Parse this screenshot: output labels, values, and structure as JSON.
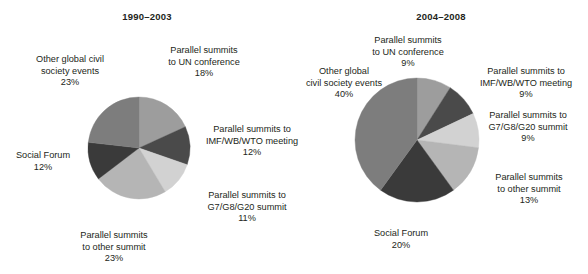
{
  "figure": {
    "type": "two-pie-figure",
    "background": "#ffffff",
    "text_color": "#231f20"
  },
  "palette": {
    "un_conference": "#9d9d9d",
    "imf_wb_wto": "#4a4a4a",
    "g7_g8_g20": "#d2d2d2",
    "other_summit": "#b5b5b5",
    "social_forum": "#3a3a3a",
    "other_global_civil_society": "#7d7d7d"
  },
  "chart_data": [
    {
      "type": "pie",
      "title": "1990–2003",
      "xlabel": "",
      "ylabel": "",
      "start_angle": 0,
      "direction": "clockwise",
      "legend": "none",
      "grid": false,
      "categories": [
        "Parallel summits to UN conference",
        "Parallel summits to IMF/WB/WTO meeting",
        "Parallel summits to G7/G8/G20 summit",
        "Parallel summits to other summit",
        "Social Forum",
        "Other global civil society events"
      ],
      "values": [
        18,
        12,
        11,
        23,
        12,
        23
      ],
      "value_labels": [
        "18%",
        "12%",
        "11%",
        "23%",
        "12%",
        "23%"
      ],
      "colors": [
        "#9d9d9d",
        "#4a4a4a",
        "#d2d2d2",
        "#b5b5b5",
        "#3a3a3a",
        "#7d7d7d"
      ],
      "slices": [
        {
          "key": "un_conference",
          "lines": [
            "Parallel summits",
            "to UN conference"
          ],
          "percent": "18%",
          "color": "#9d9d9d"
        },
        {
          "key": "imf_wb_wto",
          "lines": [
            "Parallel summits to",
            "IMF/WB/WTO meeting"
          ],
          "percent": "12%",
          "color": "#4a4a4a"
        },
        {
          "key": "g7_g8_g20",
          "lines": [
            "Parallel summits to",
            "G7/G8/G20 summit"
          ],
          "percent": "11%",
          "color": "#d2d2d2"
        },
        {
          "key": "other_summit",
          "lines": [
            "Parallel summits",
            "to other summit"
          ],
          "percent": "23%",
          "color": "#b5b5b5"
        },
        {
          "key": "social_forum",
          "lines": [
            "Social Forum"
          ],
          "percent": "12%",
          "color": "#3a3a3a"
        },
        {
          "key": "other_global_civil_society",
          "lines": [
            "Other global civil",
            "society events"
          ],
          "percent": "23%",
          "color": "#7d7d7d"
        }
      ]
    },
    {
      "type": "pie",
      "title": "2004–2008",
      "xlabel": "",
      "ylabel": "",
      "start_angle": 0,
      "direction": "clockwise",
      "legend": "none",
      "grid": false,
      "categories": [
        "Parallel summits to UN conference",
        "Parallel summits to IMF/WB/WTO meeting",
        "Parallel summits to G7/G8/G20 summit",
        "Parallel summits to other summit",
        "Social Forum",
        "Other global civil society events"
      ],
      "values": [
        9,
        9,
        9,
        13,
        20,
        40
      ],
      "value_labels": [
        "9%",
        "9%",
        "9%",
        "13%",
        "20%",
        "40%"
      ],
      "colors": [
        "#9d9d9d",
        "#4a4a4a",
        "#d2d2d2",
        "#b5b5b5",
        "#3a3a3a",
        "#7d7d7d"
      ],
      "slices": [
        {
          "key": "un_conference",
          "lines": [
            "Parallel summits",
            "to UN conference"
          ],
          "percent": "9%",
          "color": "#9d9d9d"
        },
        {
          "key": "imf_wb_wto",
          "lines": [
            "Parallel summits to",
            "IMF/WB/WTO meeting"
          ],
          "percent": "9%",
          "color": "#4a4a4a"
        },
        {
          "key": "g7_g8_g20",
          "lines": [
            "Parallel summits to",
            "G7/G8/G20 summit"
          ],
          "percent": "9%",
          "color": "#d2d2d2"
        },
        {
          "key": "other_summit",
          "lines": [
            "Parallel summits",
            "to other summit"
          ],
          "percent": "13%",
          "color": "#b5b5b5"
        },
        {
          "key": "social_forum",
          "lines": [
            "Social Forum"
          ],
          "percent": "20%",
          "color": "#3a3a3a"
        },
        {
          "key": "other_global_civil_society",
          "lines": [
            "Other global",
            "civil society events"
          ],
          "percent": "40%",
          "color": "#7d7d7d"
        }
      ]
    }
  ]
}
